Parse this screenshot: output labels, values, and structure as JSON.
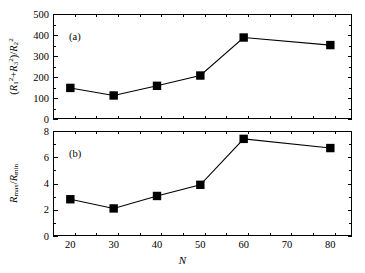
{
  "figure": {
    "width": 365,
    "height": 273,
    "background": "#ffffff",
    "foreground": "#000000"
  },
  "chart_data": [
    {
      "type": "line",
      "panel_label": "(a)",
      "title": "",
      "xlabel": "N",
      "ylabel": "(R_1^2+R_3^2)/R_2^2",
      "ylabel_parts": {
        "open": "(",
        "r1": "R",
        "r1_sub": "1",
        "r1_sup": "2",
        "plus": "+",
        "r3": "R",
        "r3_sub": "3",
        "r3_sup": "2",
        "close": ")/",
        "r2": "R",
        "r2_sub": "2",
        "r2_sup": "2"
      },
      "x": [
        20,
        30,
        40,
        50,
        60,
        80
      ],
      "values": [
        148,
        112,
        158,
        207,
        388,
        352
      ],
      "xlim": [
        16,
        85
      ],
      "ylim": [
        0,
        500
      ],
      "xticks": [
        20,
        30,
        40,
        50,
        60,
        70,
        80
      ],
      "xticklabels": [
        "20",
        "30",
        "40",
        "50",
        "60",
        "70",
        "80"
      ],
      "yticks": [
        0,
        100,
        200,
        300,
        400,
        500
      ],
      "yticklabels": [
        "0",
        "100",
        "200",
        "300",
        "400",
        "500"
      ],
      "minor_x_step": 5,
      "minor_y_step": 50,
      "grid": false,
      "legend": null,
      "marker": "filled-square",
      "marker_color": "#000000",
      "line_color": "#000000",
      "show_xticklabels": false
    },
    {
      "type": "line",
      "panel_label": "(b)",
      "title": "",
      "xlabel": "N",
      "ylabel": "R_max/R_min",
      "ylabel_parts": {
        "rmax": "R",
        "rmax_sub": "max",
        "slash": "/",
        "rmin": "R",
        "rmin_sub": "min"
      },
      "x": [
        20,
        30,
        40,
        50,
        60,
        80
      ],
      "values": [
        2.8,
        2.1,
        3.05,
        3.9,
        7.4,
        6.7
      ],
      "xlim": [
        16,
        85
      ],
      "ylim": [
        0,
        8
      ],
      "xticks": [
        20,
        30,
        40,
        50,
        60,
        70,
        80
      ],
      "xticklabels": [
        "20",
        "30",
        "40",
        "50",
        "60",
        "70",
        "80"
      ],
      "yticks": [
        0,
        2,
        4,
        6,
        8
      ],
      "yticklabels": [
        "0",
        "2",
        "4",
        "6",
        "8"
      ],
      "minor_x_step": 5,
      "minor_y_step": 1,
      "grid": false,
      "legend": null,
      "marker": "filled-square",
      "marker_color": "#000000",
      "line_color": "#000000",
      "show_xticklabels": true
    }
  ],
  "axis_title_x": "N"
}
